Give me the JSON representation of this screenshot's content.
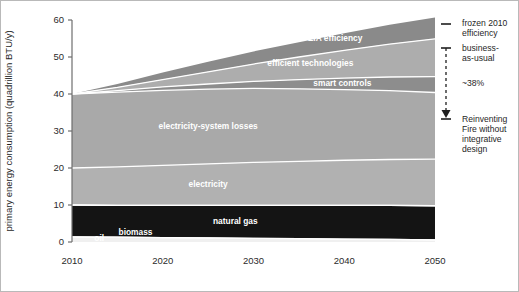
{
  "chart_data": {
    "type": "area",
    "title": "",
    "xlabel": "",
    "ylabel": "primary energy consumption (quadrillion BTU/y)",
    "xlim": [
      2010,
      2050
    ],
    "ylim": [
      0,
      60
    ],
    "xticks": [
      2010,
      2020,
      2030,
      2040,
      2050
    ],
    "xtick_labels": [
      "2010",
      "2020",
      "2030",
      "2040",
      "2050"
    ],
    "yticks": [
      0,
      10,
      20,
      30,
      40,
      50,
      60
    ],
    "ytick_labels": [
      "0",
      "10",
      "20",
      "30",
      "40",
      "50",
      "60"
    ],
    "grid": false,
    "legend": "inline-labels",
    "stacking": "stacked-area-bottom-up",
    "x": [
      2010,
      2015,
      2020,
      2025,
      2030,
      2035,
      2040,
      2045,
      2050
    ],
    "series": [
      {
        "name": "oil",
        "label": "oil",
        "color": "#f0f0f0",
        "label_color": "#ffffff",
        "values": [
          1.4,
          1.3,
          1.2,
          1.1,
          1.0,
          0.9,
          0.8,
          0.7,
          0.6
        ]
      },
      {
        "name": "biomass",
        "label": "biomass",
        "color": "#141414",
        "label_color": "#ffffff",
        "values": [
          8.6,
          8.6,
          8.7,
          8.8,
          8.9,
          9.0,
          9.1,
          9.2,
          9.2
        ]
      },
      {
        "name": "natural gas",
        "label": "natural gas",
        "color": "#141414",
        "label_color": "#ffffff",
        "values": [
          0.0,
          0.0,
          0.0,
          0.0,
          0.0,
          0.0,
          0.0,
          0.0,
          0.0
        ]
      },
      {
        "name": "electricity",
        "label": "electricity",
        "color": "#b1b1b1",
        "label_color": "#ffffff",
        "values": [
          10.0,
          10.4,
          10.8,
          11.2,
          11.6,
          11.9,
          12.2,
          12.4,
          12.6
        ]
      },
      {
        "name": "electricity-system losses",
        "label": "electricity-system losses",
        "color": "#a9a9a9",
        "label_color": "#ffffff",
        "values": [
          20.0,
          20.2,
          20.3,
          20.2,
          20.0,
          19.6,
          19.1,
          18.6,
          18.0
        ]
      },
      {
        "name": "smart controls",
        "label": "smart controls",
        "color": "#8d8d8d",
        "label_color": "#ffffff",
        "values": [
          0.0,
          0.4,
          0.9,
          1.4,
          1.9,
          2.5,
          3.1,
          3.7,
          4.3
        ]
      },
      {
        "name": "efficient technologies",
        "label": "efficient technologies",
        "color": "#adadad",
        "label_color": "#ffffff",
        "values": [
          0.0,
          0.9,
          2.0,
          3.3,
          4.7,
          6.1,
          7.5,
          8.9,
          10.2
        ]
      },
      {
        "name": "EIA efficiency",
        "label": "EIA efficiency",
        "color": "#8a8a8a",
        "label_color": "#ffffff",
        "values": [
          0.0,
          0.9,
          1.9,
          2.7,
          3.4,
          4.0,
          4.6,
          5.2,
          5.8
        ]
      }
    ],
    "totals": [
      40.0,
      42.7,
      45.8,
      48.7,
      51.5,
      54.0,
      56.4,
      58.7,
      60.7
    ],
    "annotations": [
      {
        "name": "frozen-2010-efficiency",
        "text": "frozen 2010 efficiency",
        "lines": [
          "frozen 2010",
          "efficiency"
        ],
        "marker": "tick",
        "y_value": 54.0
      },
      {
        "name": "business-as-usual",
        "text": "business-as-usual",
        "lines": [
          "business-",
          "as-usual"
        ],
        "marker": "arrow-top",
        "y_value": 47.5
      },
      {
        "name": "reduction-percent",
        "text": "~38%",
        "lines": [
          "~38%"
        ],
        "marker": "dashed-arrow",
        "y_value": 40.0
      },
      {
        "name": "reinventing-fire",
        "text": "Reinventing Fire without integrative design",
        "lines": [
          "Reinventing",
          "Fire without",
          "integrative",
          "design"
        ],
        "marker": "arrow-bottom",
        "y_value": 33.5
      }
    ]
  }
}
